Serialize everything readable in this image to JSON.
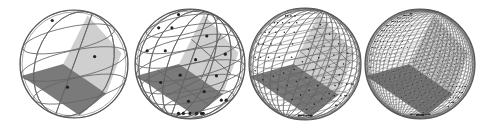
{
  "figure": {
    "colors": {
      "background": "#ffffff",
      "outline": "#555555",
      "light_face": "#cfcfcf",
      "dark_face": "#7a7a7a",
      "grid_line": "#666666",
      "dot": "#222222"
    },
    "spheres": [
      {
        "id": "nside-1",
        "cx": 74,
        "cy": 64,
        "r": 54,
        "subdiv": 1
      },
      {
        "id": "nside-2",
        "cx": 190,
        "cy": 64,
        "r": 55,
        "subdiv": 2
      },
      {
        "id": "nside-4",
        "cx": 305,
        "cy": 64,
        "r": 56,
        "subdiv": 4
      },
      {
        "id": "nside-8",
        "cx": 420,
        "cy": 64,
        "r": 55,
        "subdiv": 8
      }
    ]
  }
}
